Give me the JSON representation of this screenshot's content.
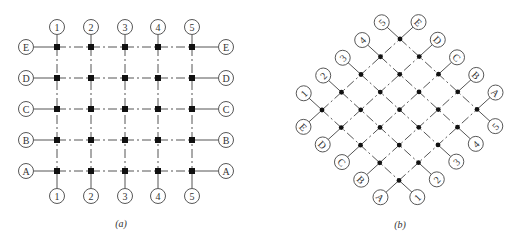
{
  "figure": {
    "panel_a": {
      "caption": "(a)",
      "description": "Orthogonal axis grid",
      "column_labels": [
        "1",
        "2",
        "3",
        "4",
        "5"
      ],
      "row_labels": [
        "E",
        "D",
        "C",
        "B",
        "A"
      ],
      "node_shape": "square"
    },
    "panel_b": {
      "caption": "(b)",
      "description": "Axis grid rotated 45 degrees",
      "column_labels": [
        "1",
        "2",
        "3",
        "4",
        "5"
      ],
      "row_labels": [
        "E",
        "D",
        "C",
        "B",
        "A"
      ],
      "node_shape": "dot"
    }
  }
}
